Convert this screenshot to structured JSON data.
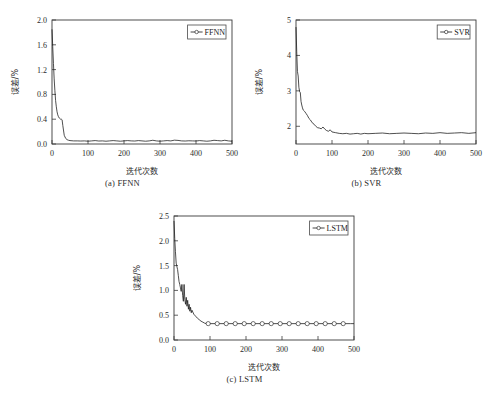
{
  "figure": {
    "background": "#ffffff",
    "line_color": "#141414",
    "axis_color": "#3a3a3a",
    "text_color": "#2b2b2b"
  },
  "panels": [
    {
      "id": "a",
      "caption": "(a) FFNN",
      "legend_label": "FFNN"
    },
    {
      "id": "b",
      "caption": "(b) SVR",
      "legend_label": "SVR"
    },
    {
      "id": "c",
      "caption": "(c) LSTM",
      "legend_label": "LSTM"
    }
  ],
  "chart_data": [
    {
      "type": "line",
      "title": "(a) FFNN",
      "xlabel": "迭代次数",
      "ylabel": "误差/%",
      "xlim": [
        0,
        500
      ],
      "ylim": [
        0.0,
        2.0
      ],
      "xticks": [
        0,
        100,
        200,
        300,
        400,
        500
      ],
      "yticks": [
        0.0,
        0.4,
        0.8,
        1.2,
        1.6,
        2.0
      ],
      "xticklabels": [
        "0",
        "100",
        "200",
        "300",
        "400",
        "500"
      ],
      "yticklabels": [
        "0.0",
        "0.4",
        "0.8",
        "1.2",
        "1.6",
        "2.0"
      ],
      "grid": false,
      "legend": {
        "position": "top-right",
        "entries": [
          "FFNN"
        ]
      },
      "markers": false,
      "series": [
        {
          "name": "FFNN",
          "x": [
            0,
            2,
            4,
            6,
            8,
            10,
            12,
            14,
            16,
            18,
            20,
            22,
            24,
            26,
            28,
            30,
            34,
            38,
            42,
            46,
            50,
            60,
            70,
            80,
            90,
            100,
            110,
            120,
            130,
            140,
            150,
            160,
            170,
            180,
            190,
            200,
            210,
            220,
            230,
            240,
            250,
            260,
            270,
            280,
            290,
            300,
            310,
            320,
            330,
            340,
            350,
            360,
            370,
            380,
            390,
            400,
            410,
            420,
            430,
            440,
            450,
            460,
            470,
            480,
            490,
            500
          ],
          "y": [
            1.85,
            1.57,
            1.3,
            1.05,
            0.86,
            0.7,
            0.6,
            0.52,
            0.47,
            0.44,
            0.42,
            0.41,
            0.4,
            0.4,
            0.39,
            0.3,
            0.14,
            0.09,
            0.07,
            0.06,
            0.055,
            0.05,
            0.05,
            0.048,
            0.05,
            0.045,
            0.05,
            0.055,
            0.048,
            0.05,
            0.045,
            0.05,
            0.055,
            0.05,
            0.045,
            0.05,
            0.055,
            0.05,
            0.048,
            0.055,
            0.05,
            0.045,
            0.05,
            0.06,
            0.05,
            0.045,
            0.05,
            0.055,
            0.05,
            0.062,
            0.058,
            0.05,
            0.048,
            0.052,
            0.05,
            0.048,
            0.055,
            0.05,
            0.045,
            0.05,
            0.06,
            0.055,
            0.05,
            0.06,
            0.05,
            0.045
          ]
        }
      ]
    },
    {
      "type": "line",
      "title": "(b) SVR",
      "xlabel": "迭代次数",
      "ylabel": "误差/%",
      "xlim": [
        0,
        500
      ],
      "ylim": [
        1.5,
        5.0
      ],
      "xticks": [
        0,
        100,
        200,
        300,
        400,
        500
      ],
      "yticks": [
        2,
        3,
        4,
        5
      ],
      "xticklabels": [
        "0",
        "100",
        "200",
        "300",
        "400",
        "500"
      ],
      "yticklabels": [
        "2",
        "3",
        "4",
        "5"
      ],
      "grid": false,
      "legend": {
        "position": "top-right",
        "entries": [
          "SVR"
        ]
      },
      "markers": false,
      "series": [
        {
          "name": "SVR",
          "x": [
            0,
            2,
            4,
            6,
            8,
            10,
            12,
            14,
            16,
            18,
            20,
            24,
            28,
            32,
            36,
            40,
            45,
            50,
            55,
            60,
            65,
            70,
            75,
            80,
            85,
            90,
            95,
            100,
            110,
            120,
            130,
            140,
            150,
            160,
            170,
            180,
            190,
            200,
            220,
            240,
            260,
            280,
            300,
            320,
            340,
            360,
            380,
            400,
            420,
            440,
            460,
            480,
            500
          ],
          "y": [
            4.8,
            4.1,
            3.55,
            3.42,
            3.1,
            2.98,
            2.95,
            2.7,
            2.6,
            2.52,
            2.46,
            2.42,
            2.36,
            2.3,
            2.22,
            2.18,
            2.1,
            2.06,
            2.0,
            1.96,
            1.95,
            1.93,
            1.98,
            1.92,
            1.88,
            1.86,
            1.9,
            1.84,
            1.82,
            1.8,
            1.79,
            1.8,
            1.78,
            1.79,
            1.8,
            1.78,
            1.8,
            1.79,
            1.8,
            1.81,
            1.79,
            1.8,
            1.81,
            1.8,
            1.79,
            1.81,
            1.8,
            1.82,
            1.8,
            1.81,
            1.82,
            1.8,
            1.82
          ]
        }
      ]
    },
    {
      "type": "line",
      "title": "(c) LSTM",
      "xlabel": "迭代次数",
      "ylabel": "误差/%",
      "xlim": [
        0,
        500
      ],
      "ylim": [
        0.0,
        2.5
      ],
      "xticks": [
        0,
        100,
        200,
        300,
        400,
        500
      ],
      "yticks": [
        0.0,
        0.5,
        1.0,
        1.5,
        2.0,
        2.5
      ],
      "xticklabels": [
        "0",
        "100",
        "200",
        "300",
        "400",
        "500"
      ],
      "yticklabels": [
        "0.0",
        "0.5",
        "1.0",
        "1.5",
        "2.0",
        "2.5"
      ],
      "grid": false,
      "legend": {
        "position": "top-right",
        "entries": [
          "LSTM"
        ]
      },
      "markers": true,
      "marker_shape": "circle",
      "marker_x": [
        95,
        120,
        145,
        170,
        195,
        220,
        245,
        270,
        295,
        320,
        345,
        370,
        395,
        420,
        445,
        470
      ],
      "marker_y": [
        0.33,
        0.33,
        0.33,
        0.33,
        0.33,
        0.33,
        0.33,
        0.33,
        0.33,
        0.33,
        0.33,
        0.33,
        0.33,
        0.33,
        0.33,
        0.33
      ],
      "series": [
        {
          "name": "LSTM",
          "x": [
            0,
            2,
            4,
            6,
            8,
            10,
            12,
            14,
            16,
            18,
            20,
            22,
            24,
            26,
            28,
            30,
            32,
            34,
            36,
            38,
            40,
            42,
            44,
            46,
            48,
            50,
            55,
            60,
            65,
            70,
            75,
            80,
            85,
            90,
            95,
            120,
            145,
            170,
            195,
            220,
            245,
            270,
            295,
            320,
            345,
            370,
            395,
            420,
            445,
            470,
            490,
            500
          ],
          "y": [
            2.4,
            2.05,
            1.78,
            1.55,
            1.48,
            1.42,
            1.3,
            1.18,
            1.12,
            1.05,
            0.98,
            1.12,
            0.9,
            0.78,
            1.12,
            0.82,
            0.72,
            0.86,
            0.68,
            0.8,
            0.62,
            0.72,
            0.58,
            0.66,
            0.55,
            0.6,
            0.52,
            0.48,
            0.44,
            0.41,
            0.38,
            0.36,
            0.34,
            0.33,
            0.33,
            0.33,
            0.33,
            0.33,
            0.33,
            0.33,
            0.33,
            0.33,
            0.33,
            0.33,
            0.33,
            0.33,
            0.33,
            0.33,
            0.33,
            0.33,
            0.33,
            0.33
          ]
        }
      ]
    }
  ]
}
